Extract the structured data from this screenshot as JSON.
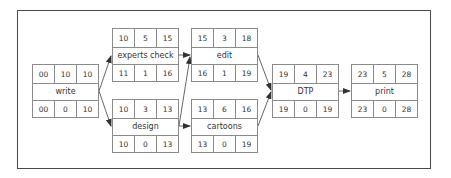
{
  "diagram": {
    "type": "critical-path-network",
    "colors": {
      "frame": "#4a4a4a",
      "cell_border": "#8a8a8a",
      "text": "#333333",
      "arrow": "#333333"
    },
    "nodes": [
      {
        "id": "write",
        "label": "write",
        "top": [
          "00",
          "10",
          "10"
        ],
        "bottom": [
          "00",
          "0",
          "10"
        ],
        "x": 32,
        "y": 64
      },
      {
        "id": "experts-check",
        "label": "experts check",
        "top": [
          "10",
          "5",
          "15"
        ],
        "bottom": [
          "11",
          "1",
          "16"
        ],
        "x": 112,
        "y": 28
      },
      {
        "id": "design",
        "label": "design",
        "top": [
          "10",
          "3",
          "13"
        ],
        "bottom": [
          "10",
          "0",
          "13"
        ],
        "x": 112,
        "y": 99
      },
      {
        "id": "edit",
        "label": "edit",
        "top": [
          "15",
          "3",
          "18"
        ],
        "bottom": [
          "16",
          "1",
          "19"
        ],
        "x": 191,
        "y": 28
      },
      {
        "id": "cartoons",
        "label": "cartoons",
        "top": [
          "13",
          "6",
          "16"
        ],
        "bottom": [
          "13",
          "0",
          "19"
        ],
        "x": 191,
        "y": 99
      },
      {
        "id": "dtp",
        "label": "DTP",
        "top": [
          "19",
          "4",
          "23"
        ],
        "bottom": [
          "19",
          "0",
          "19"
        ],
        "x": 272,
        "y": 64
      },
      {
        "id": "print",
        "label": "print",
        "top": [
          "23",
          "5",
          "28"
        ],
        "bottom": [
          "23",
          "0",
          "28"
        ],
        "x": 351,
        "y": 64
      }
    ],
    "edges": [
      {
        "from": "write",
        "to": "experts-check"
      },
      {
        "from": "write",
        "to": "design"
      },
      {
        "from": "experts-check",
        "to": "edit"
      },
      {
        "from": "design",
        "to": "edit"
      },
      {
        "from": "design",
        "to": "cartoons"
      },
      {
        "from": "edit",
        "to": "dtp"
      },
      {
        "from": "cartoons",
        "to": "dtp"
      },
      {
        "from": "dtp",
        "to": "print"
      }
    ]
  }
}
